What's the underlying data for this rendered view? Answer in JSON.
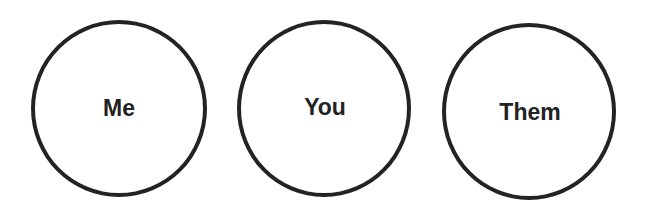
{
  "diagram": {
    "type": "circles",
    "stroke_color": "#232323",
    "text_color": "#222222",
    "background": "#ffffff",
    "nodes": [
      {
        "id": "me",
        "label": "Me"
      },
      {
        "id": "you",
        "label": "You"
      },
      {
        "id": "them",
        "label": "Them"
      }
    ]
  }
}
